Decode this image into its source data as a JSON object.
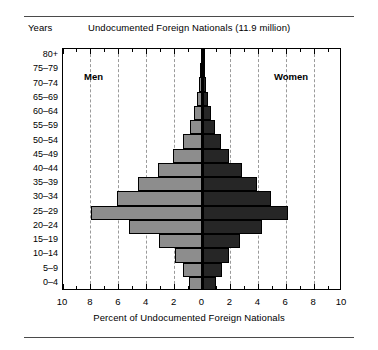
{
  "header": {
    "years_label": "Years",
    "title": "Undocumented Foreign Nationals (11.9 million)"
  },
  "axis": {
    "x_title": "Percent of Undocumented Foreign Nationals",
    "x_tick_labels": [
      "10",
      "8",
      "6",
      "4",
      "2",
      "0",
      "2",
      "4",
      "6",
      "8",
      "10"
    ],
    "y_tick_labels": [
      "80+",
      "75–79",
      "70–74",
      "65–69",
      "60–64",
      "55–59",
      "50–54",
      "45–49",
      "40–44",
      "35–39",
      "30–34",
      "25–29",
      "20–24",
      "15–19",
      "10–14",
      "5–9",
      "0–4"
    ]
  },
  "series_labels": {
    "left": "Men",
    "right": "Women"
  },
  "colors": {
    "male_bar": "#8d8d8d",
    "female_bar": "#262626",
    "frame": "#000000",
    "gridline": "#9a9a9a",
    "background": "#ffffff"
  },
  "chart_data": {
    "type": "bar",
    "subtype": "population-pyramid",
    "title": "Undocumented Foreign Nationals (11.9 million)",
    "xlabel": "Percent of Undocumented Foreign Nationals",
    "ylabel": "Years",
    "xlim": [
      -10,
      10
    ],
    "x_ticks": [
      -10,
      -8,
      -6,
      -4,
      -2,
      0,
      2,
      4,
      6,
      8,
      10
    ],
    "x_tick_labels": [
      "10",
      "8",
      "6",
      "4",
      "2",
      "0",
      "2",
      "4",
      "6",
      "8",
      "10"
    ],
    "grid": true,
    "gridlines_at": [
      -8,
      -6,
      -4,
      -2,
      2,
      4,
      6,
      8
    ],
    "legend": "in-plot",
    "categories": [
      "80+",
      "75–79",
      "70–74",
      "65–69",
      "60–64",
      "55–59",
      "50–54",
      "45–49",
      "40–44",
      "35–39",
      "30–34",
      "25–29",
      "20–24",
      "15–19",
      "10–14",
      "5–9",
      "0–4"
    ],
    "series": [
      {
        "name": "Men",
        "side": "left",
        "color": "#8d8d8d",
        "values": [
          0.1,
          0.15,
          0.25,
          0.4,
          0.6,
          0.9,
          1.4,
          2.1,
          3.2,
          4.6,
          6.1,
          8.0,
          5.3,
          3.1,
          2.0,
          1.4,
          1.0
        ]
      },
      {
        "name": "Women",
        "side": "right",
        "color": "#262626",
        "values": [
          0.1,
          0.15,
          0.25,
          0.4,
          0.6,
          0.9,
          1.3,
          1.9,
          2.8,
          3.9,
          4.9,
          6.1,
          4.3,
          2.7,
          1.9,
          1.4,
          1.0
        ]
      }
    ]
  }
}
